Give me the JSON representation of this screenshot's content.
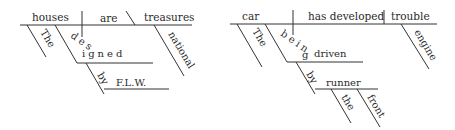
{
  "diagrams": [
    {
      "sentence": "The houses designed by F.L.W. are national treasures",
      "subject": "houses",
      "verb": "are",
      "complement": "treasures",
      "subject_modifiers": [
        "The"
      ],
      "participle": "designed",
      "participle_prep": "by",
      "participle_prep_object": "F.L.W.",
      "complement_modifiers": [
        "national"
      ]
    },
    {
      "sentence": "The car being driven by the front runner has developed engine trouble",
      "subject": "car",
      "verb": "has developed",
      "object": "trouble",
      "subject_modifiers": [
        "The"
      ],
      "participle_aux": "being",
      "participle": "driven",
      "participle_prep": "by",
      "participle_prep_object": "runner",
      "prep_object_modifiers": [
        "the",
        "front"
      ],
      "object_modifiers": [
        "engine"
      ]
    }
  ],
  "colors": {
    "line": "#333333",
    "text": "#2a2a2a",
    "background": "#ffffff"
  }
}
